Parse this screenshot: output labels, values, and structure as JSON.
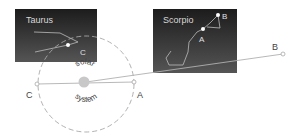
{
  "diagram": {
    "constellations": [
      {
        "name": "Taurus",
        "star_label": "C"
      },
      {
        "name": "Scorpio",
        "star_labels": [
          "A",
          "B"
        ]
      }
    ],
    "center_label_top": "solar",
    "center_label_bottom": "system",
    "orbit_points": {
      "left": "C",
      "right": "A",
      "far": "B"
    },
    "colors": {
      "panel_top": "#1a1a1a",
      "panel_bottom": "#5a5a5a",
      "sun": "#c8c8c8",
      "orbit": "#a8a8a8",
      "line": "#b0b0b0",
      "text": "#444444"
    }
  }
}
